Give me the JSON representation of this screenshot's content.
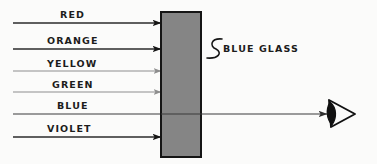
{
  "figure": {
    "background_color": "#fbfbfa"
  },
  "rays": [
    {
      "label": "RED",
      "y": 23,
      "color": "#2b2b2b",
      "label_x": 60,
      "label_y": 10,
      "line_width": 1.5,
      "arrow": "dark",
      "passes_through": false
    },
    {
      "label": "ORANGE",
      "y": 49,
      "color": "#2b2b2b",
      "label_x": 47,
      "label_y": 36,
      "line_width": 1.5,
      "arrow": "dark",
      "passes_through": false
    },
    {
      "label": "YELLOW",
      "y": 71,
      "color": "#8d8d8d",
      "label_x": 47,
      "label_y": 59,
      "line_width": 1.2,
      "arrow": "light",
      "passes_through": false
    },
    {
      "label": "GREEN",
      "y": 92,
      "color": "#8d8d8d",
      "label_x": 52,
      "label_y": 80,
      "line_width": 1.2,
      "arrow": "light",
      "passes_through": false
    },
    {
      "label": "BLUE",
      "y": 114,
      "color": "#3a3a3a",
      "label_x": 57,
      "label_y": 101,
      "line_width": 1.2,
      "arrow": "none",
      "passes_through": true
    },
    {
      "label": "VIOLET",
      "y": 137,
      "color": "#2b2b2b",
      "label_x": 47,
      "label_y": 124,
      "line_width": 1.5,
      "arrow": "dark",
      "passes_through": false
    }
  ],
  "ray_geometry": {
    "start_x": 13,
    "end_x": 161,
    "exit_x": 201,
    "eye_arrow_x": 327
  },
  "glass": {
    "label": "BLUE GLASS",
    "label_x": 223,
    "label_y": 44,
    "x": 161,
    "y": 12,
    "width": 40,
    "height": 145,
    "fill_color": "#858585",
    "stroke_color": "#151515"
  },
  "eye": {
    "name": "observer eye",
    "x": 341,
    "y": 113
  }
}
